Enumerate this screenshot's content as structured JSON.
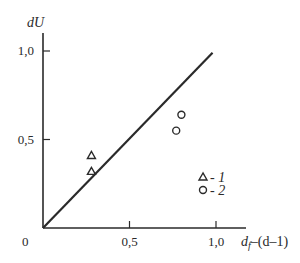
{
  "chart_data": {
    "type": "scatter",
    "title": "",
    "xlabel": "d_f–(d–1)",
    "xlabel_parts": {
      "main": "d",
      "sub": "f",
      "rest": "–(d–1)"
    },
    "ylabel": "dU",
    "xlim": [
      0,
      1.15
    ],
    "ylim": [
      0,
      1.1
    ],
    "grid": false,
    "origin_label": "0",
    "x_ticks": [
      {
        "value": 0.5,
        "label": "0,5"
      },
      {
        "value": 1.0,
        "label": "1,0"
      }
    ],
    "y_ticks": [
      {
        "value": 0.5,
        "label": "0,5"
      },
      {
        "value": 1.0,
        "label": "1,0"
      }
    ],
    "reference_line": {
      "name": "y = x",
      "x": [
        0,
        0.98
      ],
      "y": [
        0,
        0.99
      ]
    },
    "series": [
      {
        "name": "1",
        "marker": "triangle",
        "points": [
          {
            "x": 0.28,
            "y": 0.41
          },
          {
            "x": 0.28,
            "y": 0.32
          }
        ]
      },
      {
        "name": "2",
        "marker": "circle",
        "points": [
          {
            "x": 0.8,
            "y": 0.64
          },
          {
            "x": 0.77,
            "y": 0.55
          }
        ]
      }
    ],
    "legend": {
      "position": "lower-right",
      "entries": [
        {
          "marker": "triangle",
          "text": "- ",
          "num": "1"
        },
        {
          "marker": "circle",
          "text": "- ",
          "num": "2"
        }
      ]
    }
  },
  "colors": {
    "ink": "#2a2a2a",
    "background": "#ffffff"
  }
}
